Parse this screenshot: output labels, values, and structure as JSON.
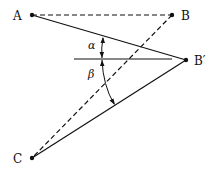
{
  "diagram": {
    "points": {
      "A": {
        "label": "A",
        "x": 32,
        "y": 15
      },
      "B": {
        "label": "B",
        "x": 172,
        "y": 15
      },
      "Bprime": {
        "label": "B′",
        "x": 186,
        "y": 60
      },
      "C": {
        "label": "C",
        "x": 32,
        "y": 158
      }
    },
    "angles": {
      "alpha": "α",
      "beta": "β"
    },
    "colors": {
      "line": "#111111",
      "background": "#ffffff"
    }
  }
}
